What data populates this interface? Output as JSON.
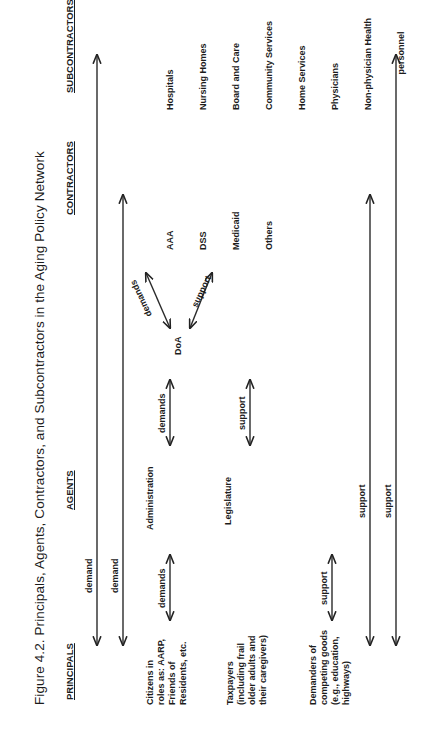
{
  "figure": {
    "title": "Figure 4.2. Principals, Agents, Contractors, and Subcontractors in the Aging Policy Network",
    "columns": {
      "principals": "PRINCIPALS",
      "agents": "AGENTS",
      "contractors": "CONTRACTORS",
      "subcontractors": "SUBCONTRACTORS"
    },
    "principals": [
      "Citizens in\nroles as: AARP,\nFriends of\nResidents, etc.",
      "Taxpayers\n(including frail\nolder adults and\ntheir caregivers)",
      "Demanders of\ncompeting goods\n(e.g., education,\nhighways)"
    ],
    "agents": {
      "administration": "Administration",
      "legislature": "Legislature",
      "doa": "DoA"
    },
    "contractors": [
      "AAA",
      "DSS",
      "Medicaid",
      "Others"
    ],
    "subcontractors": [
      "Hospitals",
      "Nursing Homes",
      "Board and Care",
      "Community Services",
      "Home Services",
      "Physicians",
      "Non-physician Health",
      "personnel"
    ],
    "arrow_labels": {
      "top_long_1": "demand",
      "top_long_2": "demand",
      "citizens_admin": "demands",
      "admin_doa": "demands",
      "doa_contractors_upper": "demands",
      "doa_contractors_lower": "support",
      "legislature_doa": "support",
      "demanders_legislature": "support",
      "bottom_long_1": "support",
      "bottom_long_2": "support"
    }
  }
}
